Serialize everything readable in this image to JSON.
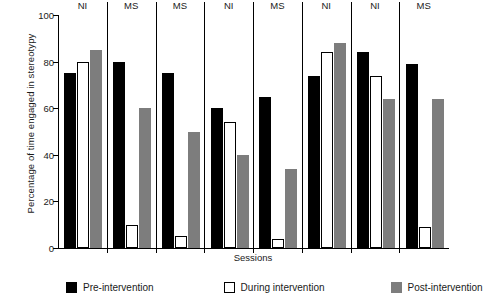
{
  "chart_data": {
    "type": "bar",
    "title": "",
    "xlabel": "Sessions",
    "ylabel": "Percentage of time engaged in stereotypy",
    "ylim": [
      0,
      100
    ],
    "yticks": [
      0,
      20,
      40,
      60,
      80,
      100
    ],
    "grid": false,
    "legend_position": "bottom",
    "categories": [
      "NI",
      "MS",
      "MS",
      "NI",
      "MS",
      "NI",
      "NI",
      "MS"
    ],
    "series": [
      {
        "name": "Pre-intervention",
        "color": "#000000",
        "values": [
          75,
          80,
          75,
          60,
          65,
          74,
          84,
          79
        ]
      },
      {
        "name": "During intervention",
        "color": "#ffffff",
        "values": [
          80,
          10,
          5,
          54,
          4,
          84,
          74,
          9
        ]
      },
      {
        "name": "Post-intervention",
        "color": "#7d7d7d",
        "values": [
          85,
          60,
          50,
          40,
          34,
          88,
          64,
          64
        ]
      }
    ]
  },
  "axes": {
    "y_title": "Percentage of time engaged in stereotypy",
    "x_title": "Sessions",
    "y_tick_labels": [
      "0",
      "20",
      "40",
      "60",
      "80",
      "100"
    ]
  },
  "groups": [
    {
      "label": "NI"
    },
    {
      "label": "MS"
    },
    {
      "label": "MS"
    },
    {
      "label": "NI"
    },
    {
      "label": "MS"
    },
    {
      "label": "NI"
    },
    {
      "label": "NI"
    },
    {
      "label": "MS"
    }
  ],
  "legend": {
    "items": [
      {
        "label": "Pre-intervention",
        "swatch": "black-square-icon"
      },
      {
        "label": "During intervention",
        "swatch": "white-square-icon"
      },
      {
        "label": "Post-intervention",
        "swatch": "gray-square-icon"
      }
    ]
  }
}
